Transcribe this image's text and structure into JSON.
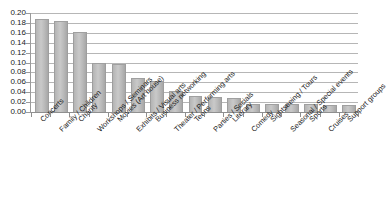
{
  "chart_data": {
    "type": "bar",
    "title": "",
    "subtitle": "",
    "xlabel": "",
    "ylabel": "",
    "ylim": [
      0.0,
      0.2
    ],
    "grid": true,
    "legend": false,
    "orientation": "vertical",
    "y_ticks": [
      "0.00",
      "0.02",
      "0.04",
      "0.06",
      "0.08",
      "0.10",
      "0.12",
      "0.14",
      "0.16",
      "0.18",
      "0.20"
    ],
    "y_tick_values": [
      0.0,
      0.02,
      0.04,
      0.06,
      0.08,
      0.1,
      0.12,
      0.14,
      0.16,
      0.18,
      0.2
    ],
    "categories": [
      "Concerts",
      "Family / Children",
      "Charity",
      "Workshops / Seminars",
      "Movies (Art house)",
      "Exhibits / Visual arts",
      "Business networking",
      "Theater / Performing arts",
      "Teens",
      "Parties / Socials",
      "Literary",
      "Comedy",
      "Sightseeing / Tours",
      "Seasonal / Special events",
      "Sports",
      "Cruises",
      "Support groups"
    ],
    "values": [
      0.185,
      0.182,
      0.16,
      0.098,
      0.095,
      0.066,
      0.061,
      0.04,
      0.03,
      0.029,
      0.027,
      0.015,
      0.014,
      0.014,
      0.014,
      0.013,
      0.013
    ],
    "bar_color": "#bdbdbd",
    "grid_color": "#b6b6b6",
    "axis_color": "#8f8f8f",
    "text_color": "#1c1c1c",
    "background_color": "#ffffff"
  }
}
